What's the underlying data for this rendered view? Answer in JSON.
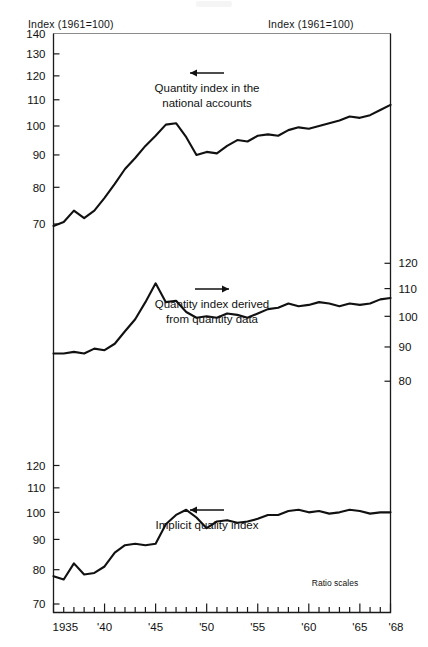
{
  "header": {
    "left_label": "Index (1961=100)",
    "right_label": "Index (1961=100)"
  },
  "footnote": "Ratio scales",
  "panels": {
    "top": {
      "annotation_line1": "Quantity index in the",
      "annotation_line2": "national accounts",
      "arrow_direction": "left",
      "y_ticks": [
        "140",
        "130",
        "120",
        "110",
        "100",
        "90",
        "80",
        "70"
      ]
    },
    "middle": {
      "annotation_line1": "Quantity index derived",
      "annotation_line2": "from quantity data",
      "arrow_direction": "right",
      "y_ticks_right": [
        "120",
        "110",
        "100",
        "90",
        "80"
      ]
    },
    "bottom": {
      "annotation_line1": "Implicit quality index",
      "annotation_line2": "",
      "arrow_direction": "left",
      "y_ticks": [
        "120",
        "110",
        "100",
        "90",
        "80",
        "70"
      ]
    }
  },
  "x_axis": {
    "labels": [
      "1935",
      "'40",
      "'45",
      "'50",
      "'55",
      "'60",
      "'65",
      "'68"
    ],
    "label_years": [
      1935,
      1940,
      1945,
      1950,
      1955,
      1960,
      1965,
      1968
    ],
    "range": [
      1935,
      1968
    ],
    "tick_interval": 1
  },
  "chart_data": {
    "type": "line",
    "title": "",
    "subtitle": "",
    "xlabel": "",
    "ylabel": "Index (1961=100)",
    "grid": false,
    "legend_position": "inline-annotations",
    "scale": "logarithmic (ratio scales)",
    "x": [
      1935,
      1936,
      1937,
      1938,
      1939,
      1940,
      1941,
      1942,
      1943,
      1944,
      1945,
      1946,
      1947,
      1948,
      1949,
      1950,
      1951,
      1952,
      1953,
      1954,
      1955,
      1956,
      1957,
      1958,
      1959,
      1960,
      1961,
      1962,
      1963,
      1964,
      1965,
      1966,
      1967,
      1968
    ],
    "panels": [
      {
        "name": "top",
        "series_name": "Quantity index in the national accounts",
        "ylim": [
          70,
          140
        ],
        "yticks": [
          70,
          80,
          90,
          100,
          110,
          120,
          130,
          140
        ],
        "values": [
          69.5,
          70.5,
          73.5,
          71.5,
          73.5,
          77.0,
          81.0,
          85.5,
          89.0,
          93.0,
          96.5,
          100.5,
          101.0,
          96.0,
          90.0,
          91.0,
          90.5,
          93.0,
          95.0,
          94.5,
          96.5,
          97.0,
          96.5,
          98.5,
          99.5,
          99.0,
          100.0,
          101.0,
          102.0,
          103.5,
          103.0,
          104.0,
          106.0,
          108.0
        ]
      },
      {
        "name": "middle",
        "series_name": "Quantity index derived from quantity data",
        "ylim": [
          75,
          130
        ],
        "yticks": [
          80,
          90,
          100,
          110,
          120
        ],
        "values": [
          88.0,
          88.0,
          88.5,
          88.0,
          89.5,
          89.0,
          91.0,
          95.0,
          99.0,
          105.0,
          112.0,
          105.0,
          105.5,
          101.5,
          99.5,
          100.0,
          99.5,
          101.0,
          100.5,
          99.5,
          101.0,
          102.5,
          103.0,
          104.5,
          103.5,
          104.0,
          105.0,
          104.5,
          103.5,
          104.5,
          104.0,
          104.5,
          106.0,
          106.5
        ]
      },
      {
        "name": "bottom",
        "series_name": "Implicit quality index",
        "ylim": [
          70,
          125
        ],
        "yticks": [
          70,
          80,
          90,
          100,
          110,
          120
        ],
        "values": [
          78.0,
          77.0,
          82.0,
          78.5,
          79.0,
          81.0,
          85.5,
          88.0,
          88.5,
          88.0,
          88.5,
          95.5,
          99.0,
          101.0,
          98.0,
          94.0,
          96.5,
          97.0,
          96.0,
          96.5,
          97.5,
          99.0,
          99.0,
          100.5,
          101.0,
          100.0,
          100.5,
          99.5,
          100.0,
          101.0,
          100.5,
          99.5,
          100.0,
          100.0
        ]
      }
    ]
  }
}
